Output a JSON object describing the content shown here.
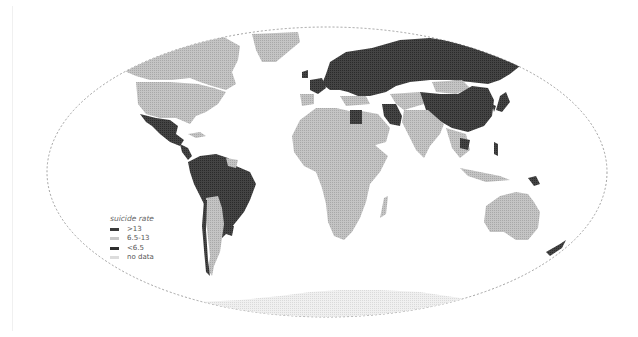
{
  "map": {
    "title": "World suicide rate map",
    "projection": "oval world projection",
    "colors": {
      "high": "#3c3c3c",
      "mid": "#b4b4b4",
      "low": "#3c3c3c",
      "no_data": "#e4e4e4",
      "graticule": "#888888",
      "background": "#ffffff"
    }
  },
  "legend": {
    "title": "suicide rate",
    "items": [
      {
        "label": ">13",
        "color": "#3a3a3a"
      },
      {
        "label": "6.5-13",
        "color": "#c8c8c8"
      },
      {
        "label": "<6.5",
        "color": "#2e2e2e"
      },
      {
        "label": "no data",
        "color": "#dcdcdc"
      }
    ]
  },
  "regions": [
    {
      "name": "Canada",
      "class": "6.5-13"
    },
    {
      "name": "United States",
      "class": "6.5-13"
    },
    {
      "name": "Greenland",
      "class": "6.5-13"
    },
    {
      "name": "Mexico",
      "class": ">13"
    },
    {
      "name": "Central America",
      "class": ">13"
    },
    {
      "name": "Northern South America",
      "class": ">13"
    },
    {
      "name": "Brazil",
      "class": ">13"
    },
    {
      "name": "Argentina",
      "class": "6.5-13"
    },
    {
      "name": "Chile",
      "class": ">13"
    },
    {
      "name": "Uruguay",
      "class": ">13"
    },
    {
      "name": "Africa",
      "class": "6.5-13"
    },
    {
      "name": "Egypt",
      "class": ">13"
    },
    {
      "name": "Europe",
      "class": ">13"
    },
    {
      "name": "Russia",
      "class": ">13"
    },
    {
      "name": "Mongolia",
      "class": "6.5-13"
    },
    {
      "name": "China",
      "class": ">13"
    },
    {
      "name": "Iran",
      "class": ">13"
    },
    {
      "name": "Arabian Peninsula",
      "class": "6.5-13"
    },
    {
      "name": "India",
      "class": "6.5-13"
    },
    {
      "name": "Thailand",
      "class": ">13"
    },
    {
      "name": "Japan",
      "class": ">13"
    },
    {
      "name": "Papua New Guinea",
      "class": ">13"
    },
    {
      "name": "Australia",
      "class": "6.5-13"
    },
    {
      "name": "New Zealand",
      "class": ">13"
    },
    {
      "name": "Antarctica",
      "class": "no data"
    }
  ]
}
